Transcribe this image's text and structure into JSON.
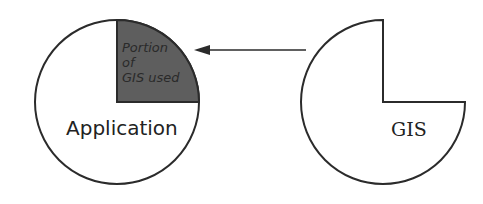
{
  "diagram": {
    "application": {
      "label": "Application"
    },
    "gis": {
      "label": "GIS"
    },
    "portion": {
      "line1": "Portion",
      "line2": "of",
      "line3": "GIS used"
    },
    "colors": {
      "stroke": "#2b2b2b",
      "wedge_fill": "#5e5e5e",
      "background": "#ffffff"
    },
    "arrow": {
      "from": "GIS",
      "to": "Portion of GIS used"
    }
  }
}
